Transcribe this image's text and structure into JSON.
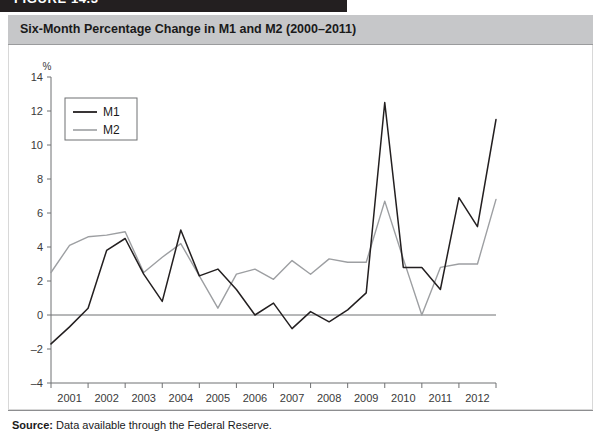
{
  "figure": {
    "banner_label": "FIGURE 14.3"
  },
  "title": "Six-Month Percentage Change in M1 and M2 (2000–2011)",
  "source": {
    "label": "Source:",
    "text": " Data available through the Federal Reserve."
  },
  "colors": {
    "m1": "#231f20",
    "m2": "#9d9fa2",
    "banner": "#231f20",
    "title_strip": "#c6c7c9",
    "axis": "#6f7072",
    "panel_bg": "#ffffff"
  },
  "chart_data": {
    "type": "line",
    "title": "Six-Month Percentage Change in M1 and M2 (2000–2011)",
    "xlabel": "",
    "ylabel": "%",
    "ylim": [
      -4,
      14
    ],
    "yticks": [
      -4,
      -2,
      0,
      2,
      4,
      6,
      8,
      10,
      12,
      14
    ],
    "ytick_labels": [
      "–4",
      "–2",
      "0",
      "2",
      "4",
      "6",
      "8",
      "10",
      "12",
      "14"
    ],
    "xlim": [
      2000,
      2012
    ],
    "xticks": [
      2000,
      2001,
      2002,
      2003,
      2004,
      2005,
      2006,
      2007,
      2008,
      2009,
      2010,
      2011,
      2012
    ],
    "xtick_labels": [
      "2001",
      "2002",
      "2003",
      "2004",
      "2005",
      "2006",
      "2007",
      "2008",
      "2009",
      "2010",
      "2011",
      "2012"
    ],
    "xtick_label_positions": [
      2000.5,
      2001.5,
      2002.5,
      2003.5,
      2004.5,
      2005.5,
      2006.5,
      2007.5,
      2008.5,
      2009.5,
      2010.5,
      2011.5
    ],
    "grid": false,
    "legend_position": "top-left",
    "x": [
      2000.0,
      2000.5,
      2001.0,
      2001.5,
      2002.0,
      2002.5,
      2003.0,
      2003.5,
      2004.0,
      2004.5,
      2005.0,
      2005.5,
      2006.0,
      2006.5,
      2007.0,
      2007.5,
      2008.0,
      2008.5,
      2009.0,
      2009.5,
      2010.0,
      2010.5,
      2011.0,
      2011.5,
      2012.0
    ],
    "series": [
      {
        "name": "M1",
        "color": "#231f20",
        "values": [
          -1.7,
          -0.7,
          0.4,
          3.8,
          4.5,
          2.4,
          0.8,
          5.0,
          2.3,
          2.7,
          1.5,
          0.0,
          0.7,
          -0.8,
          0.2,
          -0.4,
          0.3,
          1.3,
          12.5,
          2.8,
          2.8,
          1.5,
          6.9,
          5.2,
          11.5
        ]
      },
      {
        "name": "M2",
        "color": "#9d9fa2",
        "values": [
          2.5,
          4.1,
          4.6,
          4.7,
          4.9,
          2.5,
          3.4,
          4.2,
          2.3,
          0.4,
          2.4,
          2.7,
          2.1,
          3.2,
          2.4,
          3.3,
          3.1,
          3.1,
          6.7,
          3.3,
          0.0,
          2.8,
          3.0,
          3.0,
          6.8
        ]
      }
    ]
  },
  "legend": {
    "entries": [
      {
        "label": "M1",
        "color": "#231f20"
      },
      {
        "label": "M2",
        "color": "#9d9fa2"
      }
    ]
  }
}
